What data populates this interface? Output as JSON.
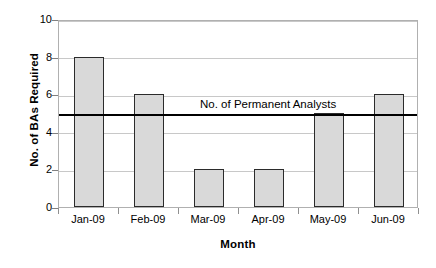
{
  "chart_data": {
    "type": "bar",
    "title": "",
    "categories": [
      "Jan-09",
      "Feb-09",
      "Mar-09",
      "Apr-09",
      "May-09",
      "Jun-09"
    ],
    "values": [
      8,
      6,
      2,
      2,
      5,
      6
    ],
    "series": [
      {
        "name": "No. of BAs Required",
        "values": [
          8,
          6,
          2,
          2,
          5,
          6
        ]
      }
    ],
    "xlabel": "Month",
    "ylabel": "No. of BAs Required",
    "ylim": [
      0,
      10
    ],
    "yticks": [
      0,
      2,
      4,
      6,
      8,
      10
    ],
    "ytick_labels": [
      "0",
      "2",
      "4",
      "6",
      "8",
      "10"
    ],
    "grid": true,
    "legend": "none",
    "annotations": [
      {
        "label": "No. of Permanent Analysts",
        "type": "threshold-line",
        "value": 5
      }
    ],
    "colors": {
      "bar_fill": "#d9d9d9",
      "bar_border": "#2b2b2b",
      "gridline": "#c8c8c8",
      "threshold_line": "#000000",
      "plot_border": "#b0b0b0",
      "text": "#000000"
    }
  }
}
